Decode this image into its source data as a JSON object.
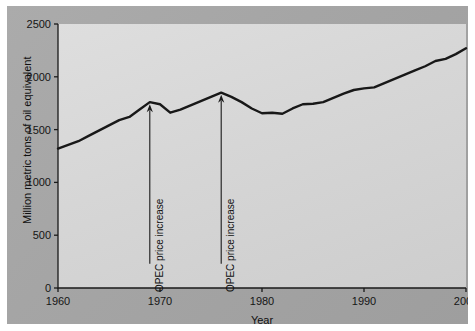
{
  "chart_data": {
    "type": "line",
    "title": "",
    "xlabel": "Year",
    "ylabel": "Million metric tons of oil equivalent",
    "xlim": [
      1960,
      2000
    ],
    "ylim": [
      0,
      2500
    ],
    "xticks": [
      1960,
      1970,
      1980,
      1990,
      2000
    ],
    "yticks": [
      0,
      500,
      1000,
      1500,
      2000,
      2500
    ],
    "xtick_labels": [
      "1960",
      "1970",
      "1980",
      "1990",
      "2000"
    ],
    "ytick_labels": [
      "0",
      "500",
      "1000",
      "1500",
      "2000",
      "2500"
    ],
    "grid": false,
    "legend": "none",
    "line_color": "#181818",
    "panel_color": "#d6d6d6",
    "background_color": "#a5a5a5",
    "series": [
      {
        "name": "Energy consumption",
        "x": [
          1960,
          1961,
          1962,
          1963,
          1964,
          1965,
          1966,
          1967,
          1968,
          1969,
          1970,
          1971,
          1972,
          1973,
          1974,
          1975,
          1976,
          1977,
          1978,
          1979,
          1980,
          1981,
          1982,
          1983,
          1984,
          1985,
          1986,
          1987,
          1988,
          1989,
          1990,
          1991,
          1992,
          1993,
          1994,
          1995,
          1996,
          1997,
          1998,
          1999,
          2000
        ],
        "values": [
          1320,
          1355,
          1390,
          1440,
          1490,
          1540,
          1590,
          1620,
          1690,
          1760,
          1740,
          1660,
          1690,
          1730,
          1770,
          1810,
          1850,
          1810,
          1760,
          1700,
          1655,
          1660,
          1650,
          1700,
          1740,
          1745,
          1760,
          1800,
          1840,
          1875,
          1890,
          1900,
          1940,
          1980,
          2020,
          2060,
          2100,
          2150,
          2170,
          2215,
          2270
        ]
      }
    ],
    "annotations": [
      {
        "label": "OPEC price increase",
        "x": 1969,
        "y": 1760,
        "text_bottom_value": 230,
        "arrow": "up"
      },
      {
        "label": "OPEC price increase",
        "x": 1976,
        "y": 1850,
        "text_bottom_value": 230,
        "arrow": "up"
      }
    ]
  }
}
